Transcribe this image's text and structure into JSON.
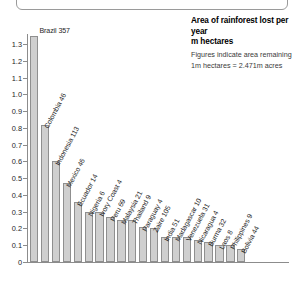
{
  "header": {
    "title_line1": "Area of rainforest lost per year",
    "title_line2": "m hectares",
    "subtitle_line1": "Figures indicate area remaining",
    "subtitle_line2": "1m hectares = 2.471m acres"
  },
  "colors": {
    "bar_fill": "#cfcfcf",
    "bar_stroke": "#8f8f8f",
    "axis": "#8c8c8c",
    "text": "#1a1a1a"
  },
  "chart_data": {
    "type": "bar",
    "title": "Area of rainforest lost per year",
    "subtitle": "m hectares",
    "notes": [
      "Figures indicate area remaining",
      "1m hectares = 2.471m acres"
    ],
    "xlabel": "",
    "ylabel": "m hectares",
    "ylim": [
      0,
      1.3
    ],
    "ytick_labels": [
      "0",
      "0.1",
      "0.2",
      "0.3",
      "0.4",
      "0.5",
      "0.6",
      "0.7",
      "0.8",
      "0.9",
      "1.0",
      "1.1",
      "1.2",
      "1.3"
    ],
    "ytick_values": [
      0,
      0.1,
      0.2,
      0.3,
      0.4,
      0.5,
      0.6,
      0.7,
      0.8,
      0.9,
      1.0,
      1.1,
      1.2,
      1.3
    ],
    "grid": false,
    "legend": "none",
    "categories": [
      "Brazil",
      "Colombia",
      "Indonesia",
      "Mexico",
      "Ecuador",
      "Nigeria",
      "Ivory Coast",
      "Peru",
      "Malaysia",
      "Thailand",
      "Paraguay",
      "Zaire",
      "India",
      "Madagascar",
      "Venezuela",
      "Nicaragua",
      "Burma",
      "Laos",
      "Philippines",
      "Bolivia"
    ],
    "bar_labels": [
      "Brazil 357",
      "Colombia 46",
      "Indonesia 113",
      "Mexico 46",
      "Ecuador 14",
      "Nigeria 6",
      "Ivory Coast 4",
      "Peru 69",
      "Malaysia 21",
      "Thailand 9",
      "Paraguay 4",
      "Zaire 105",
      "India 51",
      "Madagascar 10",
      "Venezuela 31",
      "Nicaragua 4",
      "Burma 32",
      "Laos 8",
      "Philippines 9",
      "Bolivia 44"
    ],
    "area_remaining": [
      357,
      46,
      113,
      46,
      14,
      6,
      4,
      69,
      21,
      9,
      4,
      105,
      51,
      10,
      31,
      4,
      32,
      8,
      9,
      44
    ],
    "values": [
      1.35,
      0.82,
      0.6,
      0.47,
      0.36,
      0.3,
      0.3,
      0.27,
      0.25,
      0.25,
      0.21,
      0.2,
      0.15,
      0.15,
      0.15,
      0.13,
      0.12,
      0.1,
      0.1,
      0.08
    ]
  }
}
